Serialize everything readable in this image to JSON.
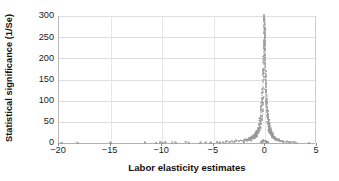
{
  "chart_data": {
    "type": "scatter",
    "title": "",
    "xlabel": "Labor elasticity estimates",
    "ylabel": "Statistical significance (1/Se)",
    "xlim": [
      -20,
      5
    ],
    "ylim": [
      0,
      300
    ],
    "xticks": [
      -20,
      -15,
      -10,
      -5,
      0,
      5
    ],
    "xticklabels": [
      "−20",
      "−15",
      "−10",
      "−5",
      "0",
      "5"
    ],
    "yticks": [
      0,
      50,
      100,
      150,
      200,
      250,
      300
    ],
    "yticklabels": [
      "0",
      "50",
      "100",
      "150",
      "200",
      "250",
      "300"
    ],
    "grid": "horizontal-and-vertical-light",
    "legend": "none",
    "marker_color": "#9a9a9a",
    "marker_shape": "circle",
    "points": [
      [
        -19.6,
        1
      ],
      [
        -18.1,
        1
      ],
      [
        -14.9,
        1
      ],
      [
        -11.6,
        2
      ],
      [
        -10.5,
        1
      ],
      [
        -10.1,
        2
      ],
      [
        -9.9,
        1
      ],
      [
        -9.6,
        2
      ],
      [
        -8.9,
        1
      ],
      [
        -8.6,
        1
      ],
      [
        -7.6,
        2
      ],
      [
        -7.3,
        1
      ],
      [
        -6.2,
        1
      ],
      [
        -5.7,
        2
      ],
      [
        -5.2,
        1
      ],
      [
        -4.6,
        2
      ],
      [
        -4.3,
        1
      ],
      [
        -4.0,
        2
      ],
      [
        -3.7,
        3
      ],
      [
        -3.4,
        2
      ],
      [
        -3.1,
        4
      ],
      [
        -2.9,
        3
      ],
      [
        -2.7,
        5
      ],
      [
        -2.5,
        4
      ],
      [
        -2.3,
        6
      ],
      [
        -2.1,
        5
      ],
      [
        -1.9,
        8
      ],
      [
        -1.8,
        7
      ],
      [
        -1.6,
        10
      ],
      [
        -1.5,
        9
      ],
      [
        -1.4,
        12
      ],
      [
        -1.3,
        11
      ],
      [
        -1.2,
        14
      ],
      [
        -1.1,
        13
      ],
      [
        -1.0,
        17
      ],
      [
        -0.95,
        16
      ],
      [
        -0.9,
        20
      ],
      [
        -0.85,
        19
      ],
      [
        -0.8,
        24
      ],
      [
        -0.75,
        23
      ],
      [
        -0.7,
        29
      ],
      [
        -0.65,
        28
      ],
      [
        -0.6,
        35
      ],
      [
        -0.55,
        34
      ],
      [
        -0.5,
        42
      ],
      [
        -0.47,
        46
      ],
      [
        -0.44,
        52
      ],
      [
        -0.41,
        58
      ],
      [
        -0.38,
        64
      ],
      [
        -0.35,
        72
      ],
      [
        -0.32,
        80
      ],
      [
        -0.29,
        88
      ],
      [
        -0.26,
        96
      ],
      [
        -0.23,
        106
      ],
      [
        -0.2,
        118
      ],
      [
        -0.18,
        130
      ],
      [
        -0.16,
        145
      ],
      [
        -0.14,
        160
      ],
      [
        -0.12,
        175
      ],
      [
        -0.1,
        192
      ],
      [
        -0.08,
        208
      ],
      [
        -0.06,
        226
      ],
      [
        -0.05,
        244
      ],
      [
        -0.04,
        260
      ],
      [
        -0.03,
        275
      ],
      [
        -0.02,
        288
      ],
      [
        -0.01,
        296
      ],
      [
        0.0,
        299
      ],
      [
        0.01,
        292
      ],
      [
        0.02,
        281
      ],
      [
        0.03,
        268
      ],
      [
        0.04,
        252
      ],
      [
        0.05,
        238
      ],
      [
        0.06,
        220
      ],
      [
        0.08,
        202
      ],
      [
        0.1,
        186
      ],
      [
        0.12,
        170
      ],
      [
        0.14,
        155
      ],
      [
        0.16,
        140
      ],
      [
        0.18,
        126
      ],
      [
        0.2,
        114
      ],
      [
        0.23,
        102
      ],
      [
        0.26,
        92
      ],
      [
        0.29,
        84
      ],
      [
        0.32,
        76
      ],
      [
        0.35,
        68
      ],
      [
        0.38,
        60
      ],
      [
        0.41,
        54
      ],
      [
        0.44,
        48
      ],
      [
        0.47,
        44
      ],
      [
        0.5,
        40
      ],
      [
        0.55,
        33
      ],
      [
        0.6,
        30
      ],
      [
        0.65,
        26
      ],
      [
        0.7,
        23
      ],
      [
        0.75,
        20
      ],
      [
        0.8,
        18
      ],
      [
        0.85,
        16
      ],
      [
        0.9,
        14
      ],
      [
        0.95,
        12
      ],
      [
        1.0,
        11
      ],
      [
        1.1,
        9
      ],
      [
        1.2,
        8
      ],
      [
        1.3,
        7
      ],
      [
        1.4,
        6
      ],
      [
        1.5,
        5
      ],
      [
        1.7,
        4
      ],
      [
        1.9,
        3
      ],
      [
        2.1,
        3
      ],
      [
        2.3,
        2
      ],
      [
        2.5,
        2
      ],
      [
        2.8,
        2
      ],
      [
        3.1,
        1
      ],
      [
        4.3,
        1
      ],
      [
        -2.0,
        2
      ],
      [
        -1.7,
        4
      ],
      [
        -1.45,
        6
      ],
      [
        -1.25,
        8
      ],
      [
        -1.05,
        11
      ],
      [
        -0.88,
        14
      ],
      [
        -0.72,
        18
      ],
      [
        -0.58,
        24
      ],
      [
        -0.48,
        30
      ],
      [
        -0.4,
        37
      ],
      [
        -0.33,
        45
      ],
      [
        -0.27,
        54
      ],
      [
        -0.22,
        63
      ],
      [
        -0.17,
        75
      ],
      [
        -0.13,
        90
      ],
      [
        -0.09,
        108
      ],
      [
        -0.07,
        128
      ],
      [
        -0.05,
        150
      ],
      [
        -0.035,
        172
      ],
      [
        -0.025,
        195
      ],
      [
        -0.015,
        215
      ],
      [
        -0.005,
        235
      ],
      [
        0.005,
        250
      ],
      [
        0.015,
        262
      ],
      [
        0.025,
        270
      ],
      [
        0.035,
        255
      ],
      [
        0.05,
        230
      ],
      [
        0.07,
        205
      ],
      [
        0.09,
        180
      ],
      [
        0.11,
        158
      ],
      [
        0.13,
        138
      ],
      [
        0.15,
        120
      ],
      [
        0.17,
        106
      ],
      [
        0.19,
        94
      ],
      [
        0.22,
        84
      ],
      [
        0.25,
        74
      ],
      [
        0.28,
        66
      ],
      [
        0.31,
        58
      ],
      [
        0.34,
        50
      ],
      [
        0.37,
        44
      ],
      [
        0.42,
        38
      ],
      [
        0.48,
        32
      ],
      [
        0.54,
        27
      ],
      [
        0.62,
        22
      ],
      [
        0.72,
        18
      ],
      [
        0.84,
        15
      ],
      [
        0.98,
        12
      ],
      [
        1.15,
        9
      ],
      [
        1.35,
        7
      ],
      [
        1.6,
        5
      ],
      [
        -0.3,
        2
      ],
      [
        -0.25,
        3
      ],
      [
        -0.2,
        4
      ],
      [
        -0.15,
        5
      ],
      [
        -0.1,
        6
      ],
      [
        0.1,
        5
      ],
      [
        0.15,
        4
      ],
      [
        0.2,
        3
      ],
      [
        0.25,
        2
      ],
      [
        0.3,
        2
      ]
    ]
  }
}
